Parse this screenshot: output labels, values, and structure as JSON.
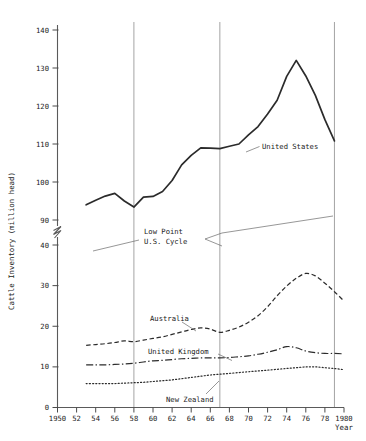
{
  "chart_data": {
    "type": "line",
    "title": "",
    "xlabel": "Year",
    "ylabel": "Cattle Inventory (million head)",
    "xlim": [
      1950,
      1980
    ],
    "x_ticks": [
      "1950",
      "52",
      "54",
      "56",
      "58",
      "60",
      "62",
      "64",
      "66",
      "68",
      "70",
      "72",
      "74",
      "76",
      "78",
      "1980"
    ],
    "x_tick_values": [
      1950,
      1952,
      1954,
      1956,
      1958,
      1960,
      1962,
      1964,
      1966,
      1968,
      1970,
      1972,
      1974,
      1976,
      1978,
      1980
    ],
    "y_ticks_lower": [
      "0",
      "10",
      "20",
      "30",
      "40"
    ],
    "y_ticks_lower_values": [
      0,
      10,
      20,
      30,
      40
    ],
    "y_ticks_upper": [
      "90",
      "100",
      "110",
      "120",
      "130",
      "140"
    ],
    "y_ticks_upper_values": [
      90,
      100,
      110,
      120,
      130,
      140
    ],
    "axis_break": {
      "present": true,
      "between": [
        40,
        90
      ],
      "symbol": "zigzag"
    },
    "grid": false,
    "legend_position": "inline-labels",
    "vertical_reference_lines": [
      1958,
      1967,
      1979
    ],
    "annotations": [
      {
        "name": "low-point-annotation",
        "text_line1": "Low Point",
        "text_line2": "U.S. Cycle",
        "points_to": [
          1958,
          1979
        ]
      }
    ],
    "series": [
      {
        "name": "United States",
        "style": "solid",
        "x": [
          1953,
          1954,
          1955,
          1956,
          1957,
          1958,
          1959,
          1960,
          1961,
          1962,
          1963,
          1964,
          1965,
          1966,
          1967,
          1968,
          1969,
          1970,
          1971,
          1972,
          1973,
          1974,
          1975,
          1976,
          1977,
          1978,
          1979
        ],
        "values": [
          94.0,
          95.2,
          96.3,
          97.0,
          95.0,
          93.4,
          96.0,
          96.2,
          97.5,
          100.4,
          104.5,
          107.0,
          109.0,
          108.9,
          108.8,
          109.4,
          110.0,
          112.4,
          114.6,
          117.9,
          121.5,
          127.8,
          132.0,
          127.9,
          122.8,
          116.4,
          110.8
        ]
      },
      {
        "name": "Australia",
        "style": "dashed",
        "x": [
          1953,
          1954,
          1955,
          1956,
          1957,
          1958,
          1959,
          1960,
          1961,
          1962,
          1963,
          1964,
          1965,
          1966,
          1967,
          1968,
          1969,
          1970,
          1971,
          1972,
          1973,
          1974,
          1975,
          1976,
          1977,
          1978,
          1979,
          1980
        ],
        "values": [
          15.3,
          15.5,
          15.7,
          16.0,
          16.4,
          16.2,
          16.6,
          17.0,
          17.4,
          18.0,
          18.6,
          19.2,
          19.6,
          19.3,
          18.5,
          19.0,
          19.8,
          21.0,
          22.6,
          24.8,
          27.5,
          29.9,
          31.8,
          33.0,
          32.4,
          30.6,
          28.5,
          26.2
        ]
      },
      {
        "name": "United Kingdom",
        "style": "dash-dot",
        "x": [
          1953,
          1954,
          1955,
          1956,
          1957,
          1958,
          1959,
          1960,
          1961,
          1962,
          1963,
          1964,
          1965,
          1966,
          1967,
          1968,
          1969,
          1970,
          1971,
          1972,
          1973,
          1974,
          1975,
          1976,
          1977,
          1978,
          1979,
          1980
        ],
        "values": [
          10.5,
          10.5,
          10.5,
          10.6,
          10.7,
          10.9,
          11.2,
          11.5,
          11.6,
          11.8,
          12.0,
          12.1,
          12.2,
          12.2,
          12.2,
          12.3,
          12.5,
          12.7,
          13.1,
          13.6,
          14.2,
          15.0,
          14.7,
          13.9,
          13.5,
          13.3,
          13.3,
          13.2
        ]
      },
      {
        "name": "New Zealand",
        "style": "dotted",
        "x": [
          1953,
          1954,
          1955,
          1956,
          1957,
          1958,
          1959,
          1960,
          1961,
          1962,
          1963,
          1964,
          1965,
          1966,
          1967,
          1968,
          1969,
          1970,
          1971,
          1972,
          1973,
          1974,
          1975,
          1976,
          1977,
          1978,
          1979,
          1980
        ],
        "values": [
          5.9,
          5.9,
          5.9,
          5.9,
          6.0,
          6.1,
          6.2,
          6.4,
          6.6,
          6.8,
          7.1,
          7.4,
          7.7,
          8.0,
          8.2,
          8.4,
          8.6,
          8.8,
          9.0,
          9.2,
          9.4,
          9.6,
          9.8,
          10.0,
          10.0,
          9.8,
          9.6,
          9.3
        ]
      }
    ]
  },
  "labels": {
    "united_states": "United States",
    "australia": "Australia",
    "united_kingdom": "United Kingdom",
    "new_zealand": "New Zealand",
    "low_point_l1": "Low Point",
    "low_point_l2": "U.S. Cycle",
    "y_axis_title": "Cattle Inventory (million head)",
    "x_axis_title": "Year"
  },
  "colors": {
    "ink": "#2b2b2b",
    "axis": "#5a5a5a",
    "vline": "#9a9a9a",
    "background": "#ffffff"
  }
}
